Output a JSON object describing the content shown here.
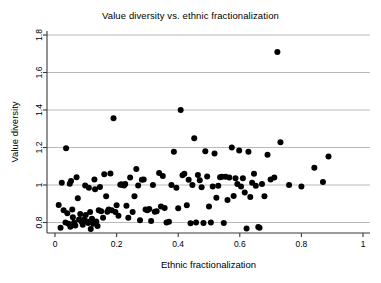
{
  "chart_data": {
    "type": "scatter",
    "title": "Value diversity vs. ethnic fractionalization",
    "xlabel": "Ethnic fractionalization",
    "ylabel": "Value diversity",
    "xlim": [
      0,
      1
    ],
    "ylim": [
      0.74,
      1.84
    ],
    "xticks": [
      0,
      0.2,
      0.4,
      0.6,
      0.8,
      1
    ],
    "xtick_labels": [
      "0",
      "0.2",
      "0.4",
      "0.6",
      "0.8",
      "1"
    ],
    "yticks": [
      0.8,
      1.0,
      1.2,
      1.4,
      1.6,
      1.8
    ],
    "ytick_labels": [
      "0.8",
      "1",
      "1.2",
      "1.4",
      "1.6",
      "1.8"
    ],
    "grid": "horizontal",
    "legend": null,
    "marker": "filled-circle",
    "marker_color": "#000000",
    "marker_size_px": 4.2,
    "n_points": 132,
    "points": [
      [
        0.012,
        0.893
      ],
      [
        0.018,
        0.772
      ],
      [
        0.022,
        1.012
      ],
      [
        0.028,
        0.866
      ],
      [
        0.034,
        0.8
      ],
      [
        0.036,
        1.196
      ],
      [
        0.04,
        0.85
      ],
      [
        0.044,
        0.793
      ],
      [
        0.048,
        1.007
      ],
      [
        0.05,
        0.777
      ],
      [
        0.052,
        1.021
      ],
      [
        0.056,
        0.869
      ],
      [
        0.058,
        0.828
      ],
      [
        0.062,
        0.8
      ],
      [
        0.066,
        0.784
      ],
      [
        0.07,
        1.042
      ],
      [
        0.074,
        0.93
      ],
      [
        0.078,
        0.816
      ],
      [
        0.082,
        0.845
      ],
      [
        0.086,
        0.806
      ],
      [
        0.09,
        0.788
      ],
      [
        0.094,
        0.818
      ],
      [
        0.098,
        0.998
      ],
      [
        0.1,
        0.84
      ],
      [
        0.104,
        0.806
      ],
      [
        0.108,
        0.798
      ],
      [
        0.11,
        0.986
      ],
      [
        0.114,
        0.856
      ],
      [
        0.116,
        0.766
      ],
      [
        0.12,
        0.82
      ],
      [
        0.124,
        0.793
      ],
      [
        0.128,
        1.03
      ],
      [
        0.13,
        0.978
      ],
      [
        0.134,
        0.806
      ],
      [
        0.138,
        0.782
      ],
      [
        0.142,
        0.866
      ],
      [
        0.146,
        0.99
      ],
      [
        0.15,
        0.86
      ],
      [
        0.156,
        0.826
      ],
      [
        0.16,
        1.058
      ],
      [
        0.166,
        0.94
      ],
      [
        0.17,
        0.858
      ],
      [
        0.174,
        0.87
      ],
      [
        0.18,
        1.062
      ],
      [
        0.184,
        0.866
      ],
      [
        0.19,
        1.356
      ],
      [
        0.196,
        0.856
      ],
      [
        0.2,
        0.892
      ],
      [
        0.206,
        0.836
      ],
      [
        0.212,
        1.002
      ],
      [
        0.216,
        1.004
      ],
      [
        0.22,
        1.0
      ],
      [
        0.224,
        0.998
      ],
      [
        0.228,
        1.006
      ],
      [
        0.232,
        0.89
      ],
      [
        0.238,
        0.826
      ],
      [
        0.244,
        1.04
      ],
      [
        0.252,
        0.856
      ],
      [
        0.258,
        0.94
      ],
      [
        0.264,
        1.086
      ],
      [
        0.27,
        0.998
      ],
      [
        0.276,
        0.812
      ],
      [
        0.282,
        1.028
      ],
      [
        0.288,
        1.03
      ],
      [
        0.294,
        0.87
      ],
      [
        0.3,
        0.866
      ],
      [
        0.306,
        0.872
      ],
      [
        0.312,
        0.808
      ],
      [
        0.318,
        1.0
      ],
      [
        0.324,
        0.858
      ],
      [
        0.33,
        0.86
      ],
      [
        0.338,
        1.064
      ],
      [
        0.344,
        0.886
      ],
      [
        0.35,
        1.048
      ],
      [
        0.356,
        0.878
      ],
      [
        0.362,
        0.8
      ],
      [
        0.37,
        0.804
      ],
      [
        0.378,
        1.0
      ],
      [
        0.386,
        1.178
      ],
      [
        0.394,
        0.986
      ],
      [
        0.4,
        0.876
      ],
      [
        0.408,
        1.4
      ],
      [
        0.414,
        1.052
      ],
      [
        0.42,
        1.06
      ],
      [
        0.428,
        0.892
      ],
      [
        0.434,
        1.028
      ],
      [
        0.44,
        0.796
      ],
      [
        0.446,
        1.0
      ],
      [
        0.452,
        1.25
      ],
      [
        0.458,
        0.8
      ],
      [
        0.464,
        1.054
      ],
      [
        0.47,
        1.026
      ],
      [
        0.476,
        0.988
      ],
      [
        0.482,
        0.798
      ],
      [
        0.488,
        1.18
      ],
      [
        0.494,
        1.046
      ],
      [
        0.5,
        0.886
      ],
      [
        0.506,
        0.8
      ],
      [
        0.512,
        0.992
      ],
      [
        0.518,
        1.168
      ],
      [
        0.524,
        0.932
      ],
      [
        0.53,
        0.996
      ],
      [
        0.536,
        1.042
      ],
      [
        0.542,
        1.044
      ],
      [
        0.548,
        0.798
      ],
      [
        0.554,
        1.044
      ],
      [
        0.56,
        0.92
      ],
      [
        0.566,
        1.04
      ],
      [
        0.574,
        1.2
      ],
      [
        0.58,
        0.942
      ],
      [
        0.586,
        1.036
      ],
      [
        0.592,
        1.006
      ],
      [
        0.598,
        1.184
      ],
      [
        0.604,
        0.992
      ],
      [
        0.61,
        1.036
      ],
      [
        0.616,
        0.96
      ],
      [
        0.622,
        0.768
      ],
      [
        0.628,
        1.178
      ],
      [
        0.634,
        0.936
      ],
      [
        0.64,
        1.012
      ],
      [
        0.646,
        1.06
      ],
      [
        0.652,
        0.996
      ],
      [
        0.66,
        0.776
      ],
      [
        0.664,
        0.772
      ],
      [
        0.672,
        1.006
      ],
      [
        0.68,
        0.94
      ],
      [
        0.69,
        1.162
      ],
      [
        0.7,
        1.03
      ],
      [
        0.712,
        1.04
      ],
      [
        0.722,
        1.71
      ],
      [
        0.732,
        1.228
      ],
      [
        0.76,
        1.0
      ],
      [
        0.8,
        0.992
      ],
      [
        0.842,
        1.092
      ],
      [
        0.87,
        1.016
      ],
      [
        0.888,
        1.152
      ]
    ]
  }
}
